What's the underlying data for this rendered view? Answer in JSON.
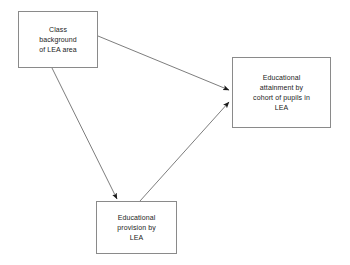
{
  "diagram": {
    "type": "flowchart",
    "title": "",
    "background_color": "#ffffff",
    "node_border_color": "#8a8a8a",
    "edge_color": "#6e6e6e",
    "arrowhead_color": "#1b1b1b",
    "nodes": [
      {
        "id": "class-background",
        "label": "Class\nbackground\nof LEA area",
        "shape": "rectangle"
      },
      {
        "id": "attainment",
        "label": "Educational\nattainment by\ncohort of pupils in\nLEA",
        "shape": "rectangle"
      },
      {
        "id": "provision",
        "label": "Educational\nprovision by\nLEA",
        "shape": "rectangle"
      }
    ],
    "edges": [
      {
        "id": "class-background-to-attainment",
        "from": "class-background",
        "to": "attainment",
        "label": "",
        "arrow": "single"
      },
      {
        "id": "class-background-to-provision",
        "from": "class-background",
        "to": "provision",
        "label": "",
        "arrow": "single"
      },
      {
        "id": "provision-to-attainment",
        "from": "provision",
        "to": "attainment",
        "label": "",
        "arrow": "single"
      }
    ]
  }
}
